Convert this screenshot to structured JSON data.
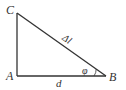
{
  "diagram": {
    "type": "right-triangle",
    "vertices": [
      {
        "label": "C",
        "x": 17,
        "y": 13
      },
      {
        "label": "A",
        "x": 17,
        "y": 76
      },
      {
        "label": "B",
        "x": 106,
        "y": 76
      }
    ],
    "edges": [
      {
        "from": "A",
        "to": "C",
        "label": ""
      },
      {
        "from": "A",
        "to": "B",
        "label": "d"
      },
      {
        "from": "C",
        "to": "B",
        "label": "Δl"
      }
    ],
    "angle": {
      "vertex": "B",
      "label": "φ"
    },
    "labels": {
      "C": "C",
      "A": "A",
      "B": "B",
      "base": "d",
      "hypotenuse": "Δl",
      "angle": "φ"
    },
    "line_color": "#333333"
  }
}
